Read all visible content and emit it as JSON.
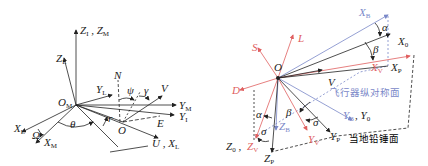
{
  "colors": {
    "ink": "#222222",
    "red": "#e06060",
    "blue": "#7a88c8"
  },
  "left_diagram": {
    "origin": "O",
    "origin_m": "O",
    "origin_m_sub": "M",
    "labels": {
      "z_i_zm": "Z",
      "z_i_sub": "I",
      "z_m_sub": "M",
      "z_l": "Z",
      "z_l_sub": "L",
      "y_l": "Y",
      "y_l_sub": "L",
      "y_m": "Y",
      "y_m_sub": "M",
      "y_i": "Y",
      "y_i_sub": "I",
      "x_l": "X",
      "x_l_sub": "L",
      "x_m": "X",
      "x_m_sub": "M",
      "u_xl": "U , X",
      "u_xl_sub": "L",
      "n": "N",
      "v": "V",
      "e": "E",
      "omega": "Ω",
      "theta": "θ",
      "r": "r",
      "psi": "ψ",
      "gamma": "γ",
      "sep": " , "
    }
  },
  "right_diagram": {
    "origin": "O",
    "labels": {
      "x_b": "X",
      "x_b_sub": "B",
      "x_0": "X",
      "x_0_sub": "0",
      "x_v": "X",
      "x_v_sub": "V",
      "x_p": "X",
      "x_p_sub": "P",
      "alpha_top": "α",
      "beta_top": "β",
      "s": "S",
      "l": "L",
      "d": "D",
      "v": "V",
      "alpha_low": "α",
      "beta_low": "β",
      "sigma_left": "σ",
      "sigma_right": "σ",
      "z_b": "Z",
      "z_b_sub": "B",
      "y_v": "Y",
      "y_v_sub": "V",
      "y_p": "Y",
      "y_p_sub": "P",
      "yb_y0": "Y",
      "yb_sub": "B",
      "y0_label": "Y",
      "y0_sub": "0",
      "z0": "Z",
      "z0_sub": "0",
      "z_v": "Z",
      "z_v_sub": "V",
      "z_p": "Z",
      "z_p_sub": "P",
      "symmetry_plane": "飞行器纵对称面",
      "vertical_plane": "当地铅锤面",
      "sep": " , "
    }
  }
}
